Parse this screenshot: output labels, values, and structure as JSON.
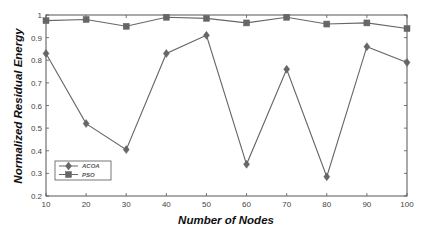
{
  "chart_data": {
    "type": "line",
    "title": "",
    "xlabel": "Number of Nodes",
    "ylabel": "Normalized Residual Energy",
    "x": [
      10,
      20,
      30,
      40,
      50,
      60,
      70,
      80,
      90,
      100
    ],
    "xlim": [
      10,
      100
    ],
    "ylim": [
      0.2,
      1
    ],
    "xticks": [
      10,
      20,
      30,
      40,
      50,
      60,
      70,
      80,
      90,
      100
    ],
    "yticks": [
      0.2,
      0.3,
      0.4,
      0.5,
      0.6,
      0.7,
      0.8,
      0.9,
      1
    ],
    "grid": false,
    "legend_position": "lower left",
    "series": [
      {
        "name": "ACOA",
        "marker": "diamond",
        "color": "#666666",
        "values": [
          0.83,
          0.52,
          0.405,
          0.83,
          0.91,
          0.34,
          0.76,
          0.285,
          0.86,
          0.79
        ]
      },
      {
        "name": "PSO",
        "marker": "square",
        "color": "#666666",
        "values": [
          0.975,
          0.98,
          0.95,
          0.99,
          0.985,
          0.965,
          0.99,
          0.96,
          0.965,
          0.94
        ]
      }
    ]
  }
}
